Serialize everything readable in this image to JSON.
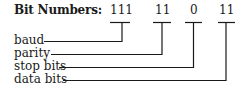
{
  "title": "Bit Numbers:",
  "fields": [
    {
      "bits": "111",
      "label": "baud"
    },
    {
      "bits": "11",
      "label": "parity"
    },
    {
      "bits": "0",
      "label": "stop bits"
    },
    {
      "bits": "11",
      "label": "data bits"
    }
  ],
  "colors": {
    "line": "#1a1a1a",
    "background": "#ffffff"
  }
}
